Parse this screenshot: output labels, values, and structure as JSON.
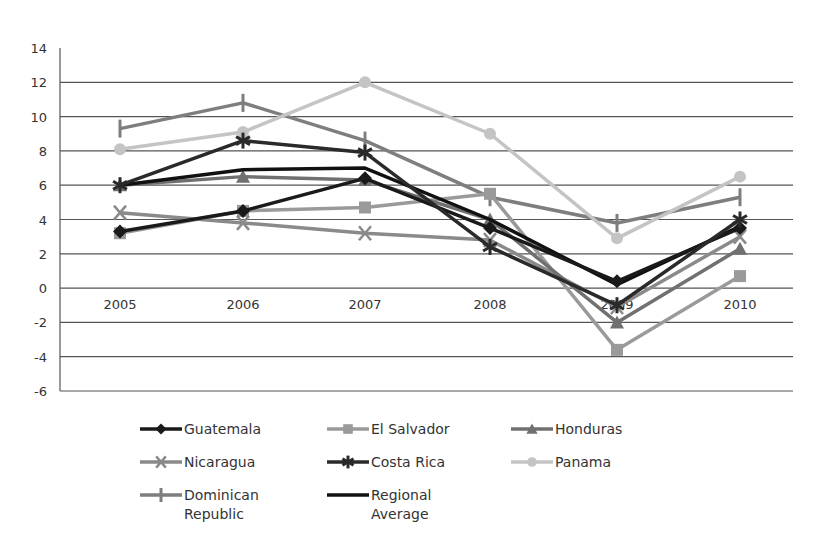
{
  "chart_data": {
    "type": "line",
    "title": "",
    "xlabel": "",
    "ylabel": "",
    "x": [
      "2005",
      "2006",
      "2007",
      "2008",
      "2009",
      "2010"
    ],
    "ylim": [
      -6,
      14
    ],
    "yticks": [
      14,
      12,
      10,
      8,
      6,
      4,
      2,
      0,
      -2,
      -4,
      -6
    ],
    "grid": true,
    "legend_position": "bottom",
    "series": [
      {
        "name": "Guatemala",
        "marker": "diamond",
        "color": "#1a1a1a",
        "values": [
          3.3,
          4.5,
          6.4,
          3.5,
          0.4,
          3.5
        ]
      },
      {
        "name": "El Salvador",
        "marker": "square",
        "color": "#9a9a9a",
        "values": [
          3.2,
          4.5,
          4.7,
          5.5,
          -3.6,
          0.7
        ]
      },
      {
        "name": "Honduras",
        "marker": "triangle",
        "color": "#707070",
        "values": [
          6.0,
          6.5,
          6.3,
          4.0,
          -2.0,
          2.3
        ]
      },
      {
        "name": "Nicaragua",
        "marker": "x",
        "color": "#8a8a8a",
        "values": [
          4.4,
          3.8,
          3.2,
          2.8,
          -1.1,
          3.0
        ]
      },
      {
        "name": "Costa Rica",
        "marker": "asterisk",
        "color": "#2a2a2a",
        "values": [
          6.0,
          8.6,
          7.9,
          2.4,
          -1.0,
          4.0
        ]
      },
      {
        "name": "Panama",
        "marker": "circle",
        "color": "#c4c4c4",
        "values": [
          8.1,
          9.1,
          12.0,
          9.0,
          2.9,
          6.5
        ]
      },
      {
        "name": "Dominican Republic",
        "marker": "plus",
        "color": "#7e7e7e",
        "values": [
          9.3,
          10.8,
          8.6,
          5.3,
          3.8,
          5.3
        ]
      },
      {
        "name": "Regional Average",
        "marker": "none",
        "color": "#111111",
        "values": [
          6.0,
          6.9,
          7.0,
          4.0,
          0.2,
          3.6
        ]
      }
    ]
  },
  "legend": {
    "items": [
      {
        "label": "Guatemala"
      },
      {
        "label": "El Salvador"
      },
      {
        "label": "Honduras"
      },
      {
        "label": "Nicaragua"
      },
      {
        "label": "Costa Rica"
      },
      {
        "label": "Panama"
      },
      {
        "label": "Dominican\nRepublic"
      },
      {
        "label": "Regional\nAverage"
      }
    ]
  }
}
